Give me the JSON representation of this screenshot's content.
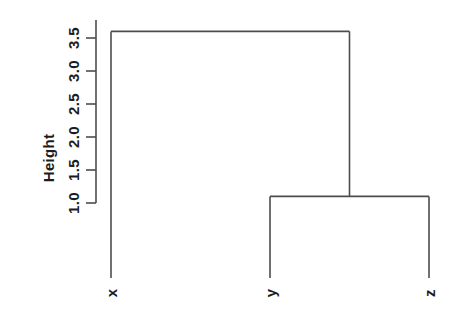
{
  "colors": {
    "line": "#4d4d4d",
    "text": "#1c1c1c",
    "background": "#ffffff"
  },
  "chart_data": {
    "type": "dendrogram",
    "title": "",
    "ylabel": "Height",
    "leaves": [
      "x",
      "y",
      "z"
    ],
    "leaf_height": 0,
    "yticks": [
      1.0,
      1.5,
      2.0,
      2.5,
      3.0,
      3.5
    ],
    "ytick_labels": [
      "1.0",
      "1.5",
      "2.0",
      "2.5",
      "3.0",
      "3.5"
    ],
    "ylim": [
      0,
      3.6
    ],
    "merges": [
      {
        "id": "yz",
        "children": [
          "y",
          "z"
        ],
        "height": 1.1
      },
      {
        "id": "root",
        "children": [
          "x",
          "yz"
        ],
        "height": 3.6
      }
    ],
    "legend": null,
    "grid": false,
    "axis_label_orientation": "rotated-90"
  }
}
